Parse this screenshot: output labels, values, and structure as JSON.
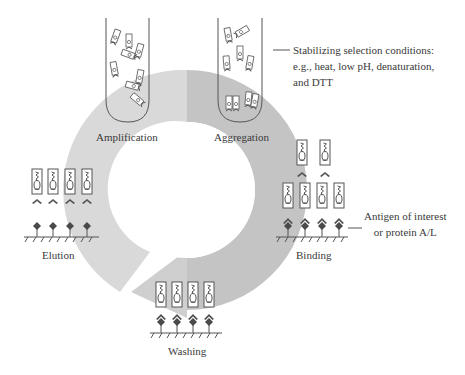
{
  "figure": {
    "colors": {
      "ring_light": "#d9d9d9",
      "ring_dark": "#c3c3c3",
      "arrow": "#cdcdcd",
      "stroke": "#555555",
      "text": "#3a3a3a",
      "antigen": "#4a4a4a"
    },
    "steps": {
      "amplification": {
        "label": "Amplification"
      },
      "aggregation": {
        "label": "Aggregation"
      },
      "binding": {
        "label": "Binding"
      },
      "washing": {
        "label": "Washing"
      },
      "elution": {
        "label": "Elution"
      }
    },
    "annotations": {
      "stabilizing": {
        "lines": [
          "Stabilizing selection conditions:",
          "e.g., heat, low pH, denaturation,",
          "and DTT"
        ]
      },
      "antigen": {
        "lines": [
          "Antigen of interest",
          "or protein A/L"
        ]
      }
    }
  }
}
